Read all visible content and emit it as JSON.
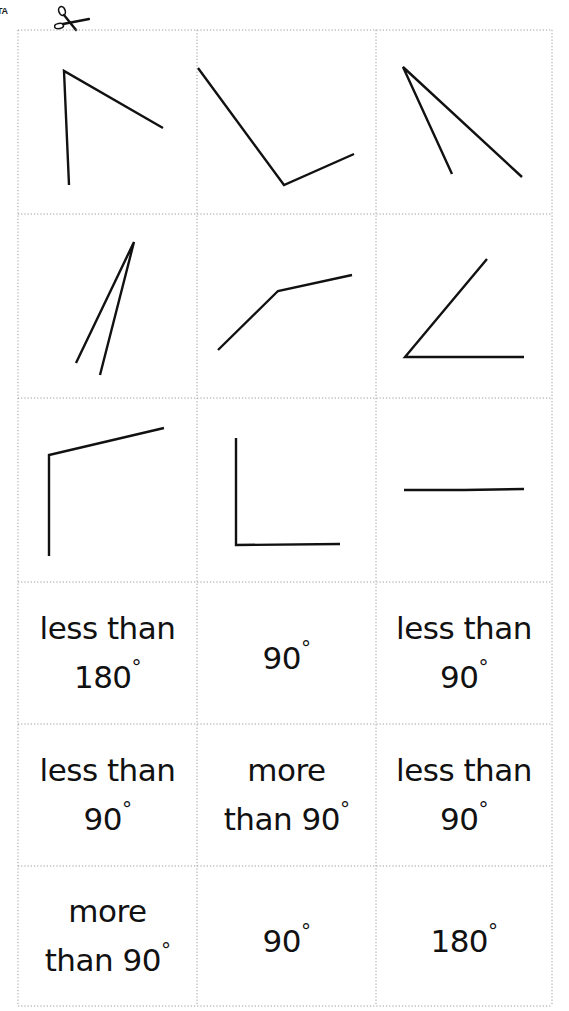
{
  "page": {
    "corner_tag": "TA",
    "cut_icon": "scissors-icon",
    "grid_line_color": "#9a9a9a",
    "ink_color": "#111111"
  },
  "grid": {
    "columns_x": [
      18,
      197,
      376,
      552
    ],
    "rows_y": [
      30,
      214,
      398,
      582,
      724,
      866,
      1006
    ]
  },
  "angle_cards": [
    {
      "id": "angle-1",
      "row": 0,
      "col": 0,
      "description": "acute-to-right angle, vertex top-left",
      "vertex": [
        64,
        71
      ],
      "arms": [
        [
          69,
          185
        ],
        [
          163,
          128
        ]
      ]
    },
    {
      "id": "angle-2",
      "row": 0,
      "col": 1,
      "description": "right angle tilted",
      "vertex": [
        284,
        185
      ],
      "arms": [
        [
          198,
          68
        ],
        [
          354,
          154
        ]
      ]
    },
    {
      "id": "angle-3",
      "row": 0,
      "col": 2,
      "description": "acute angle, vertex top-left",
      "vertex": [
        403,
        67
      ],
      "arms": [
        [
          452,
          174
        ],
        [
          522,
          177
        ]
      ]
    },
    {
      "id": "angle-4",
      "row": 1,
      "col": 0,
      "description": "very acute angle, vertex top",
      "vertex": [
        134,
        242
      ],
      "arms": [
        [
          76,
          363
        ],
        [
          100,
          375
        ]
      ]
    },
    {
      "id": "angle-5",
      "row": 1,
      "col": 1,
      "description": "obtuse angle",
      "vertex": [
        278,
        291
      ],
      "arms": [
        [
          218,
          350
        ],
        [
          352,
          275
        ]
      ]
    },
    {
      "id": "angle-6",
      "row": 1,
      "col": 2,
      "description": "acute angle, vertex bottom-left",
      "vertex": [
        405,
        357
      ],
      "arms": [
        [
          487,
          259
        ],
        [
          524,
          357
        ]
      ]
    },
    {
      "id": "angle-7",
      "row": 2,
      "col": 0,
      "description": "obtuse angle, vertex top-left",
      "vertex": [
        49,
        455
      ],
      "arms": [
        [
          49,
          556
        ],
        [
          164,
          428
        ]
      ]
    },
    {
      "id": "angle-8",
      "row": 2,
      "col": 1,
      "description": "right angle L-shape",
      "vertex": [
        236,
        545
      ],
      "arms": [
        [
          236,
          438
        ],
        [
          340,
          544
        ]
      ]
    },
    {
      "id": "angle-9",
      "row": 2,
      "col": 2,
      "description": "straight angle",
      "vertex": [
        464,
        490
      ],
      "arms": [
        [
          404,
          490
        ],
        [
          524,
          489
        ]
      ]
    }
  ],
  "label_cards": [
    {
      "row": 3,
      "col": 0,
      "line1": "less than",
      "line2": "180",
      "deg": "°"
    },
    {
      "row": 3,
      "col": 1,
      "line1": "",
      "line2": "90",
      "deg": "°"
    },
    {
      "row": 3,
      "col": 2,
      "line1": "less than",
      "line2": "90",
      "deg": "°"
    },
    {
      "row": 4,
      "col": 0,
      "line1": "less than",
      "line2": "90",
      "deg": "°"
    },
    {
      "row": 4,
      "col": 1,
      "line1": "more",
      "line2": "than 90",
      "deg": "°"
    },
    {
      "row": 4,
      "col": 2,
      "line1": "less than",
      "line2": "90",
      "deg": "°"
    },
    {
      "row": 5,
      "col": 0,
      "line1": "more",
      "line2": "than 90",
      "deg": "°"
    },
    {
      "row": 5,
      "col": 1,
      "line1": "",
      "line2": "90",
      "deg": "°"
    },
    {
      "row": 5,
      "col": 2,
      "line1": "",
      "line2": "180",
      "deg": "°"
    }
  ]
}
